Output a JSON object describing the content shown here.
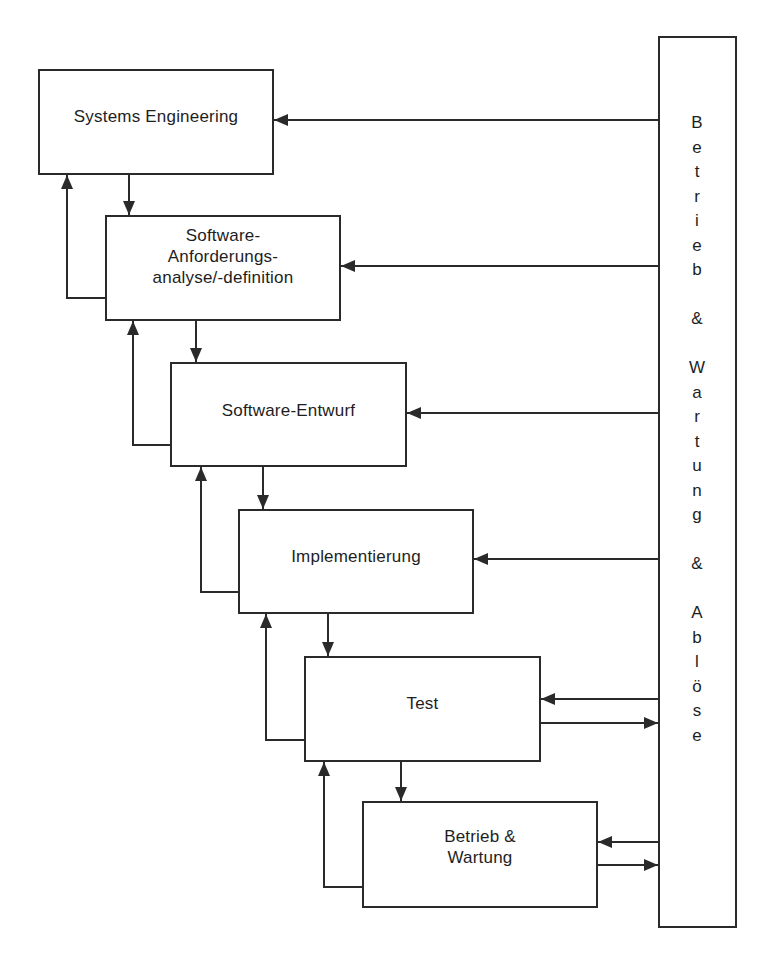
{
  "diagram": {
    "type": "process-flow",
    "stroke_color": "#2a2a2a",
    "text_color": "#1e1e1e",
    "background": "#ffffff",
    "phases": [
      {
        "id": "systems-engineering",
        "lines": [
          "Systems Engineering"
        ],
        "x": 38,
        "y": 69,
        "w": 236,
        "h": 106,
        "valign": "top",
        "pad_top": 35
      },
      {
        "id": "requirements-analysis",
        "lines": [
          "Software-",
          "Anforderungs-",
          "analyse/-definition"
        ],
        "x": 105,
        "y": 215,
        "w": 236,
        "h": 106,
        "valign": "top",
        "pad_top": 8
      },
      {
        "id": "software-design",
        "lines": [
          "Software-Entwurf"
        ],
        "x": 170,
        "y": 362,
        "w": 237,
        "h": 105,
        "valign": "top",
        "pad_top": 36
      },
      {
        "id": "implementation",
        "lines": [
          "Implementierung"
        ],
        "x": 238,
        "y": 509,
        "w": 236,
        "h": 105,
        "valign": "top",
        "pad_top": 35
      },
      {
        "id": "test",
        "lines": [
          "Test"
        ],
        "x": 304,
        "y": 656,
        "w": 237,
        "h": 106,
        "valign": "top",
        "pad_top": 35
      },
      {
        "id": "operation-maintenance",
        "lines": [
          "Betrieb &",
          "Wartung"
        ],
        "x": 362,
        "y": 801,
        "w": 236,
        "h": 107,
        "valign": "top",
        "pad_top": 23
      }
    ],
    "side_bar": {
      "id": "operation-maintenance-replacement",
      "text": "Betrieb & Wartung & Ablöse",
      "chars": [
        "B",
        "e",
        "t",
        "r",
        "i",
        "e",
        "b",
        "",
        "&",
        "",
        "W",
        "a",
        "r",
        "t",
        "u",
        "n",
        "g",
        "",
        "&",
        "",
        "A",
        "b",
        "l",
        "ö",
        "s",
        "e"
      ],
      "x": 658,
      "y": 36,
      "w": 79,
      "h": 892,
      "char_center_x": 697,
      "first_char_y": 123,
      "char_step": 24.5
    },
    "connections": [
      {
        "from": "systems-engineering",
        "to": "requirements-analysis",
        "kind": "forward-down",
        "points": [
          [
            129,
            175
          ],
          [
            129,
            215
          ]
        ]
      },
      {
        "from": "requirements-analysis",
        "to": "systems-engineering",
        "kind": "feedback-up",
        "points": [
          [
            105,
            298
          ],
          [
            67,
            298
          ],
          [
            67,
            175
          ]
        ]
      },
      {
        "from": "requirements-analysis",
        "to": "software-design",
        "kind": "forward-down",
        "points": [
          [
            196,
            321
          ],
          [
            196,
            362
          ]
        ]
      },
      {
        "from": "software-design",
        "to": "requirements-analysis",
        "kind": "feedback-up",
        "points": [
          [
            170,
            445
          ],
          [
            133,
            445
          ],
          [
            133,
            321
          ]
        ]
      },
      {
        "from": "software-design",
        "to": "implementation",
        "kind": "forward-down",
        "points": [
          [
            263,
            467
          ],
          [
            263,
            509
          ]
        ]
      },
      {
        "from": "implementation",
        "to": "software-design",
        "kind": "feedback-up",
        "points": [
          [
            238,
            592
          ],
          [
            201,
            592
          ],
          [
            201,
            467
          ]
        ]
      },
      {
        "from": "implementation",
        "to": "test",
        "kind": "forward-down",
        "points": [
          [
            328,
            614
          ],
          [
            328,
            656
          ]
        ]
      },
      {
        "from": "test",
        "to": "implementation",
        "kind": "feedback-up",
        "points": [
          [
            304,
            740
          ],
          [
            266,
            740
          ],
          [
            266,
            614
          ]
        ]
      },
      {
        "from": "test",
        "to": "operation-maintenance",
        "kind": "forward-down",
        "points": [
          [
            401,
            762
          ],
          [
            401,
            801
          ]
        ]
      },
      {
        "from": "operation-maintenance",
        "to": "test",
        "kind": "feedback-up",
        "points": [
          [
            362,
            887
          ],
          [
            324,
            887
          ],
          [
            324,
            762
          ]
        ]
      },
      {
        "from": "operation-maintenance-replacement",
        "to": "systems-engineering",
        "kind": "side-in",
        "points": [
          [
            658,
            120
          ],
          [
            274,
            120
          ]
        ]
      },
      {
        "from": "operation-maintenance-replacement",
        "to": "requirements-analysis",
        "kind": "side-in",
        "points": [
          [
            658,
            266
          ],
          [
            341,
            266
          ]
        ]
      },
      {
        "from": "operation-maintenance-replacement",
        "to": "software-design",
        "kind": "side-in",
        "points": [
          [
            658,
            413
          ],
          [
            407,
            413
          ]
        ]
      },
      {
        "from": "operation-maintenance-replacement",
        "to": "implementation",
        "kind": "side-in",
        "points": [
          [
            658,
            559
          ],
          [
            474,
            559
          ]
        ]
      },
      {
        "from": "operation-maintenance-replacement",
        "to": "test",
        "kind": "side-in",
        "points": [
          [
            658,
            699
          ],
          [
            541,
            699
          ]
        ]
      },
      {
        "from": "test",
        "to": "operation-maintenance-replacement",
        "kind": "side-out",
        "points": [
          [
            541,
            723
          ],
          [
            658,
            723
          ]
        ]
      },
      {
        "from": "operation-maintenance-replacement",
        "to": "operation-maintenance",
        "kind": "side-in",
        "points": [
          [
            658,
            842
          ],
          [
            598,
            842
          ]
        ]
      },
      {
        "from": "operation-maintenance",
        "to": "operation-maintenance-replacement",
        "kind": "side-out",
        "points": [
          [
            598,
            865
          ],
          [
            658,
            865
          ]
        ]
      }
    ]
  }
}
